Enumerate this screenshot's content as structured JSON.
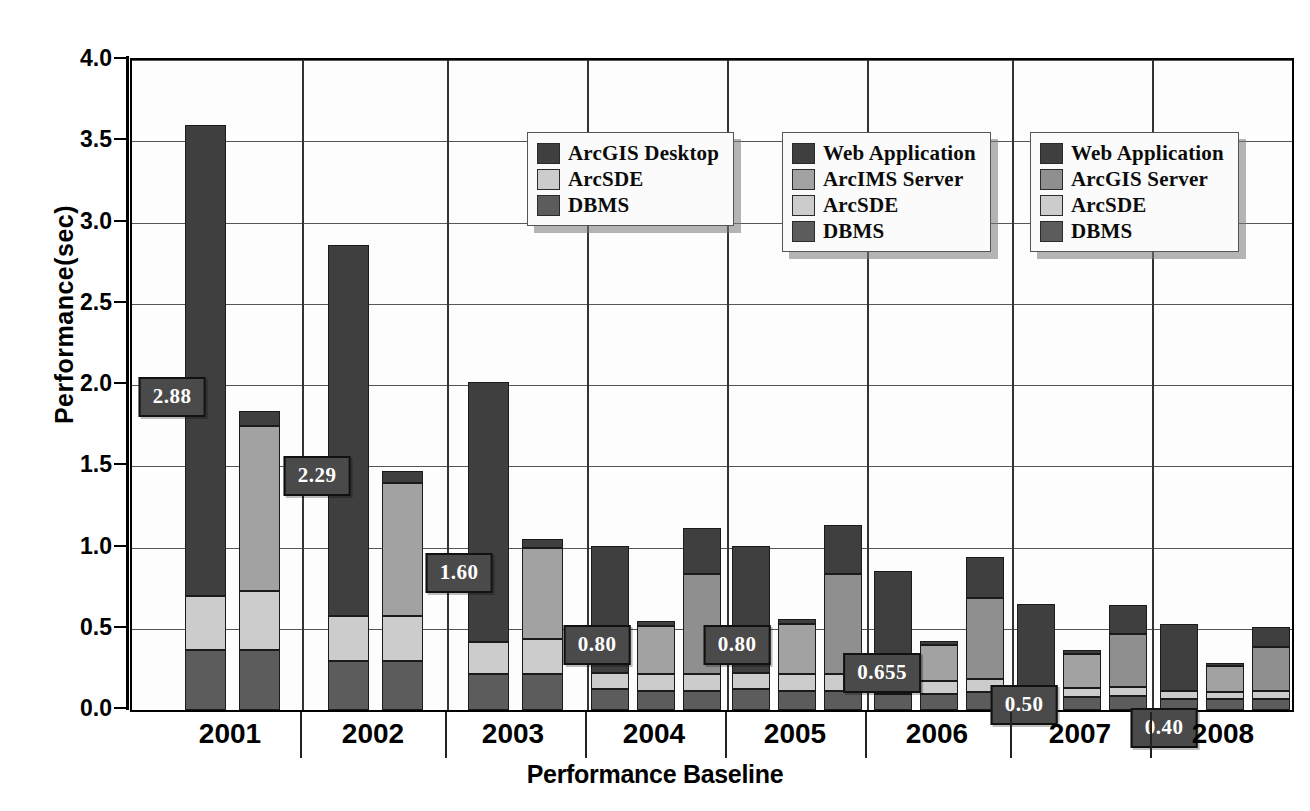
{
  "chart_data": {
    "type": "bar",
    "title": "",
    "xlabel": "Performance Baseline",
    "ylabel": "Performance(sec)",
    "ylim": [
      0,
      4.0
    ],
    "yticks": [
      "0.0",
      "0.5",
      "1.0",
      "1.5",
      "2.0",
      "2.5",
      "3.0",
      "3.5",
      "4.0"
    ],
    "grid": true,
    "stacked": true,
    "categories": [
      "2001",
      "2002",
      "2003",
      "2004",
      "2005",
      "2006",
      "2007",
      "2008"
    ],
    "colors": {
      "web_application": "#3f3f3f",
      "arcgis_desktop": "#3f3f3f",
      "arcims_server": "#a2a2a2",
      "arcgis_server": "#8f8f8f",
      "arcsde": "#cccccc",
      "dbms": "#5c5c5c",
      "callout_bg": "#4a4a4a",
      "callout_text": "#ffffff"
    },
    "legends": [
      {
        "name": "desktop-legend",
        "entries": [
          {
            "label": "ArcGIS Desktop",
            "color": "#3f3f3f"
          },
          {
            "label": "ArcSDE",
            "color": "#cccccc"
          },
          {
            "label": "DBMS",
            "color": "#5c5c5c"
          }
        ]
      },
      {
        "name": "arcims-legend",
        "entries": [
          {
            "label": "Web Application",
            "color": "#3f3f3f"
          },
          {
            "label": "ArcIMS Server",
            "color": "#a2a2a2"
          },
          {
            "label": "ArcSDE",
            "color": "#cccccc"
          },
          {
            "label": "DBMS",
            "color": "#5c5c5c"
          }
        ]
      },
      {
        "name": "arcgis-server-legend",
        "entries": [
          {
            "label": "Web Application",
            "color": "#3f3f3f"
          },
          {
            "label": "ArcGIS Server",
            "color": "#8f8f8f"
          },
          {
            "label": "ArcSDE",
            "color": "#cccccc"
          },
          {
            "label": "DBMS",
            "color": "#5c5c5c"
          }
        ]
      }
    ],
    "annotations": [
      {
        "text": "2.88",
        "category": "2001",
        "value": 2.88
      },
      {
        "text": "2.29",
        "category": "2002",
        "value": 2.29
      },
      {
        "text": "1.60",
        "category": "2003",
        "value": 1.6
      },
      {
        "text": "0.80",
        "category": "2004",
        "value": 0.8
      },
      {
        "text": "0.80",
        "category": "2005",
        "value": 0.8
      },
      {
        "text": "0.655",
        "category": "2006",
        "value": 0.655
      },
      {
        "text": "0.50",
        "category": "2007",
        "value": 0.5
      },
      {
        "text": "0.40",
        "category": "2008",
        "value": 0.4
      }
    ],
    "groups": [
      {
        "category": "2001",
        "bars": [
          {
            "name": "arcgis-desktop-stack",
            "total": 3.6,
            "segments": [
              {
                "series": "DBMS",
                "value": 0.37,
                "color": "#5c5c5c"
              },
              {
                "series": "ArcSDE",
                "value": 0.33,
                "color": "#cccccc"
              },
              {
                "series": "ArcGIS Desktop",
                "value": 2.9,
                "color": "#3f3f3f"
              }
            ]
          },
          {
            "name": "arcims-stack",
            "total": 1.84,
            "segments": [
              {
                "series": "DBMS",
                "value": 0.37,
                "color": "#5c5c5c"
              },
              {
                "series": "ArcSDE",
                "value": 0.36,
                "color": "#cccccc"
              },
              {
                "series": "ArcIMS Server",
                "value": 1.02,
                "color": "#a2a2a2"
              },
              {
                "series": "Web Application",
                "value": 0.09,
                "color": "#3f3f3f"
              }
            ]
          }
        ]
      },
      {
        "category": "2002",
        "bars": [
          {
            "name": "arcgis-desktop-stack",
            "total": 2.86,
            "segments": [
              {
                "series": "DBMS",
                "value": 0.3,
                "color": "#5c5c5c"
              },
              {
                "series": "ArcSDE",
                "value": 0.28,
                "color": "#cccccc"
              },
              {
                "series": "ArcGIS Desktop",
                "value": 2.28,
                "color": "#3f3f3f"
              }
            ]
          },
          {
            "name": "arcims-stack",
            "total": 1.47,
            "segments": [
              {
                "series": "DBMS",
                "value": 0.3,
                "color": "#5c5c5c"
              },
              {
                "series": "ArcSDE",
                "value": 0.28,
                "color": "#cccccc"
              },
              {
                "series": "ArcIMS Server",
                "value": 0.82,
                "color": "#a2a2a2"
              },
              {
                "series": "Web Application",
                "value": 0.07,
                "color": "#3f3f3f"
              }
            ]
          }
        ]
      },
      {
        "category": "2003",
        "bars": [
          {
            "name": "arcgis-desktop-stack",
            "total": 2.02,
            "segments": [
              {
                "series": "DBMS",
                "value": 0.22,
                "color": "#5c5c5c"
              },
              {
                "series": "ArcSDE",
                "value": 0.2,
                "color": "#cccccc"
              },
              {
                "series": "ArcGIS Desktop",
                "value": 1.6,
                "color": "#3f3f3f"
              }
            ]
          },
          {
            "name": "arcims-stack",
            "total": 1.05,
            "segments": [
              {
                "series": "DBMS",
                "value": 0.22,
                "color": "#5c5c5c"
              },
              {
                "series": "ArcSDE",
                "value": 0.22,
                "color": "#cccccc"
              },
              {
                "series": "ArcIMS Server",
                "value": 0.56,
                "color": "#a2a2a2"
              },
              {
                "series": "Web Application",
                "value": 0.05,
                "color": "#3f3f3f"
              }
            ]
          }
        ]
      },
      {
        "category": "2004",
        "bars": [
          {
            "name": "arcgis-desktop-stack",
            "total": 1.01,
            "segments": [
              {
                "series": "DBMS",
                "value": 0.13,
                "color": "#5c5c5c"
              },
              {
                "series": "ArcSDE",
                "value": 0.1,
                "color": "#cccccc"
              },
              {
                "series": "ArcGIS Desktop",
                "value": 0.78,
                "color": "#3f3f3f"
              }
            ]
          },
          {
            "name": "arcims-stack",
            "total": 0.55,
            "segments": [
              {
                "series": "DBMS",
                "value": 0.12,
                "color": "#5c5c5c"
              },
              {
                "series": "ArcSDE",
                "value": 0.1,
                "color": "#cccccc"
              },
              {
                "series": "ArcIMS Server",
                "value": 0.3,
                "color": "#a2a2a2"
              },
              {
                "series": "Web Application",
                "value": 0.03,
                "color": "#3f3f3f"
              }
            ]
          },
          {
            "name": "arcgis-server-stack",
            "total": 1.12,
            "segments": [
              {
                "series": "DBMS",
                "value": 0.12,
                "color": "#5c5c5c"
              },
              {
                "series": "ArcSDE",
                "value": 0.1,
                "color": "#cccccc"
              },
              {
                "series": "ArcGIS Server",
                "value": 0.62,
                "color": "#8f8f8f"
              },
              {
                "series": "Web Application",
                "value": 0.28,
                "color": "#3f3f3f"
              }
            ]
          }
        ]
      },
      {
        "category": "2005",
        "bars": [
          {
            "name": "arcgis-desktop-stack",
            "total": 1.01,
            "segments": [
              {
                "series": "DBMS",
                "value": 0.13,
                "color": "#5c5c5c"
              },
              {
                "series": "ArcSDE",
                "value": 0.1,
                "color": "#cccccc"
              },
              {
                "series": "ArcGIS Desktop",
                "value": 0.78,
                "color": "#3f3f3f"
              }
            ]
          },
          {
            "name": "arcims-stack",
            "total": 0.56,
            "segments": [
              {
                "series": "DBMS",
                "value": 0.12,
                "color": "#5c5c5c"
              },
              {
                "series": "ArcSDE",
                "value": 0.1,
                "color": "#cccccc"
              },
              {
                "series": "ArcIMS Server",
                "value": 0.31,
                "color": "#a2a2a2"
              },
              {
                "series": "Web Application",
                "value": 0.03,
                "color": "#3f3f3f"
              }
            ]
          },
          {
            "name": "arcgis-server-stack",
            "total": 1.14,
            "segments": [
              {
                "series": "DBMS",
                "value": 0.12,
                "color": "#5c5c5c"
              },
              {
                "series": "ArcSDE",
                "value": 0.1,
                "color": "#cccccc"
              },
              {
                "series": "ArcGIS Server",
                "value": 0.62,
                "color": "#8f8f8f"
              },
              {
                "series": "Web Application",
                "value": 0.3,
                "color": "#3f3f3f"
              }
            ]
          }
        ]
      },
      {
        "category": "2006",
        "bars": [
          {
            "name": "arcgis-desktop-stack",
            "total": 0.855,
            "segments": [
              {
                "series": "DBMS",
                "value": 0.1,
                "color": "#5c5c5c"
              },
              {
                "series": "ArcSDE",
                "value": 0.08,
                "color": "#cccccc"
              },
              {
                "series": "ArcGIS Desktop",
                "value": 0.675,
                "color": "#3f3f3f"
              }
            ]
          },
          {
            "name": "arcims-stack",
            "total": 0.425,
            "segments": [
              {
                "series": "DBMS",
                "value": 0.1,
                "color": "#5c5c5c"
              },
              {
                "series": "ArcSDE",
                "value": 0.08,
                "color": "#cccccc"
              },
              {
                "series": "ArcIMS Server",
                "value": 0.22,
                "color": "#a2a2a2"
              },
              {
                "series": "Web Application",
                "value": 0.025,
                "color": "#3f3f3f"
              }
            ]
          },
          {
            "name": "arcgis-server-stack",
            "total": 0.94,
            "segments": [
              {
                "series": "DBMS",
                "value": 0.11,
                "color": "#5c5c5c"
              },
              {
                "series": "ArcSDE",
                "value": 0.08,
                "color": "#cccccc"
              },
              {
                "series": "ArcGIS Server",
                "value": 0.5,
                "color": "#8f8f8f"
              },
              {
                "series": "Web Application",
                "value": 0.25,
                "color": "#3f3f3f"
              }
            ]
          }
        ]
      },
      {
        "category": "2007",
        "bars": [
          {
            "name": "arcgis-desktop-stack",
            "total": 0.65,
            "segments": [
              {
                "series": "DBMS",
                "value": 0.085,
                "color": "#5c5c5c"
              },
              {
                "series": "ArcSDE",
                "value": 0.055,
                "color": "#cccccc"
              },
              {
                "series": "ArcGIS Desktop",
                "value": 0.51,
                "color": "#3f3f3f"
              }
            ]
          },
          {
            "name": "arcims-stack",
            "total": 0.37,
            "segments": [
              {
                "series": "DBMS",
                "value": 0.08,
                "color": "#5c5c5c"
              },
              {
                "series": "ArcSDE",
                "value": 0.055,
                "color": "#cccccc"
              },
              {
                "series": "ArcIMS Server",
                "value": 0.21,
                "color": "#a2a2a2"
              },
              {
                "series": "Web Application",
                "value": 0.025,
                "color": "#3f3f3f"
              }
            ]
          },
          {
            "name": "arcgis-server-stack",
            "total": 0.645,
            "segments": [
              {
                "series": "DBMS",
                "value": 0.085,
                "color": "#5c5c5c"
              },
              {
                "series": "ArcSDE",
                "value": 0.055,
                "color": "#cccccc"
              },
              {
                "series": "ArcGIS Server",
                "value": 0.33,
                "color": "#8f8f8f"
              },
              {
                "series": "Web Application",
                "value": 0.175,
                "color": "#3f3f3f"
              }
            ]
          }
        ]
      },
      {
        "category": "2008",
        "bars": [
          {
            "name": "arcgis-desktop-stack",
            "total": 0.53,
            "segments": [
              {
                "series": "DBMS",
                "value": 0.07,
                "color": "#5c5c5c"
              },
              {
                "series": "ArcSDE",
                "value": 0.045,
                "color": "#cccccc"
              },
              {
                "series": "ArcGIS Desktop",
                "value": 0.415,
                "color": "#3f3f3f"
              }
            ]
          },
          {
            "name": "arcims-stack",
            "total": 0.29,
            "segments": [
              {
                "series": "DBMS",
                "value": 0.065,
                "color": "#5c5c5c"
              },
              {
                "series": "ArcSDE",
                "value": 0.045,
                "color": "#cccccc"
              },
              {
                "series": "ArcIMS Server",
                "value": 0.16,
                "color": "#a2a2a2"
              },
              {
                "series": "Web Application",
                "value": 0.02,
                "color": "#3f3f3f"
              }
            ]
          },
          {
            "name": "arcgis-server-stack",
            "total": 0.51,
            "segments": [
              {
                "series": "DBMS",
                "value": 0.07,
                "color": "#5c5c5c"
              },
              {
                "series": "ArcSDE",
                "value": 0.045,
                "color": "#cccccc"
              },
              {
                "series": "ArcGIS Server",
                "value": 0.27,
                "color": "#8f8f8f"
              },
              {
                "series": "Web Application",
                "value": 0.125,
                "color": "#3f3f3f"
              }
            ]
          }
        ]
      }
    ]
  },
  "layout": {
    "group_boundaries_px": [
      170,
      315,
      455,
      595,
      735,
      880,
      1020
    ],
    "group_centers_px": [
      100,
      243,
      383,
      524,
      665,
      807,
      950,
      1093
    ],
    "legend_positions": [
      {
        "left": 395,
        "top": 72
      },
      {
        "left": 650,
        "top": 72
      },
      {
        "left": 898,
        "top": 72
      }
    ],
    "callouts_px": [
      {
        "text_index": 0,
        "cx": 40,
        "cy": 337
      },
      {
        "text_index": 1,
        "cx": 185,
        "cy": 416
      },
      {
        "text_index": 2,
        "cx": 327,
        "cy": 513
      },
      {
        "text_index": 3,
        "cx": 465,
        "cy": 585
      },
      {
        "text_index": 4,
        "cx": 605,
        "cy": 585
      },
      {
        "text_index": 5,
        "cx": 750,
        "cy": 613
      },
      {
        "text_index": 6,
        "cx": 892,
        "cy": 645
      },
      {
        "text_index": 7,
        "cx": 1032,
        "cy": 668
      }
    ]
  }
}
